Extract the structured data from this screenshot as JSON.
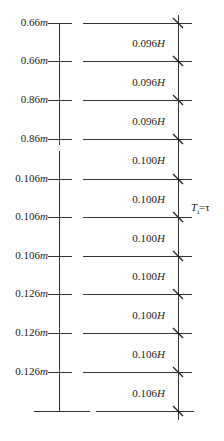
{
  "levels": [
    {
      "left_value": "0.66",
      "left_unit": "m",
      "y": 23
    },
    {
      "left_value": "0.66",
      "left_unit": "m",
      "y": 61
    },
    {
      "left_value": "0.86",
      "left_unit": "m",
      "y": 100
    },
    {
      "left_value": "0.86",
      "left_unit": "m",
      "y": 139
    },
    {
      "left_value": "0.106",
      "left_unit": "m",
      "y": 179
    },
    {
      "left_value": "0.106",
      "left_unit": "m",
      "y": 217
    },
    {
      "left_value": "0.106",
      "left_unit": "m",
      "y": 256
    },
    {
      "left_value": "0.126",
      "left_unit": "m",
      "y": 294
    },
    {
      "left_value": "0.126",
      "left_unit": "m",
      "y": 333
    },
    {
      "left_value": "0.126",
      "left_unit": "m",
      "y": 372
    },
    {
      "left_value": "",
      "left_unit": "",
      "y": 411
    }
  ],
  "intervals": [
    {
      "value": "0.096",
      "unit": "H"
    },
    {
      "value": "0.096",
      "unit": "H"
    },
    {
      "value": "0.096",
      "unit": "H"
    },
    {
      "value": "0.100",
      "unit": "H"
    },
    {
      "value": "0.100",
      "unit": "H"
    },
    {
      "value": "0.100",
      "unit": "H"
    },
    {
      "value": "0.100",
      "unit": "H"
    },
    {
      "value": "0.100",
      "unit": "H"
    },
    {
      "value": "0.106",
      "unit": "H"
    },
    {
      "value": "0.106",
      "unit": "H"
    }
  ],
  "side_label": {
    "T": "T",
    "sub": "i",
    "rest": "=τ"
  }
}
